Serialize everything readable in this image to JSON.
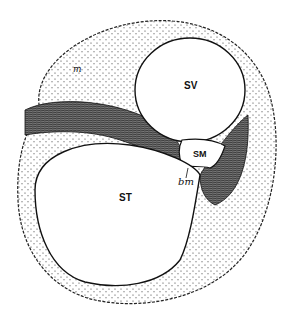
{
  "figure": {
    "labels": {
      "scala_vestibuli": "SV",
      "scala_media": "SM",
      "scala_tympani": "ST",
      "basilar_membrane": "bm",
      "top_left": "m"
    },
    "colors": {
      "ink": "#1a1a1a",
      "paper": "#ffffff",
      "tissue": "#bdbdbd"
    }
  }
}
